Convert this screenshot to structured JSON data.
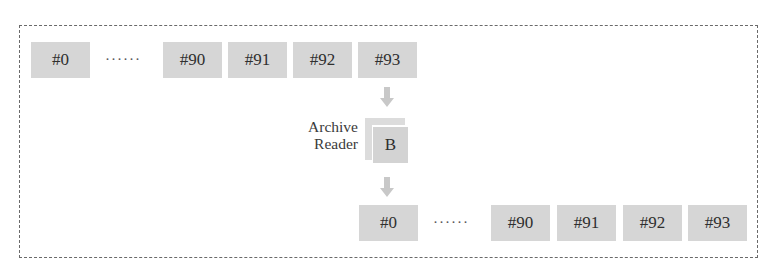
{
  "diagram": {
    "top_row": {
      "items": [
        "#0",
        "#90",
        "#91",
        "#92",
        "#93"
      ],
      "ellipsis": "······"
    },
    "process": {
      "label_line1": "Archive",
      "label_line2": "Reader",
      "buffer_label": "B"
    },
    "bottom_row": {
      "items": [
        "#0",
        "#90",
        "#91",
        "#92",
        "#93"
      ],
      "ellipsis": "······"
    },
    "colors": {
      "box_fill": "#d6d6d6",
      "arrow_fill": "#c8c8c8",
      "frame_border": "#6a6a6a",
      "text": "#2f2f2f"
    }
  }
}
